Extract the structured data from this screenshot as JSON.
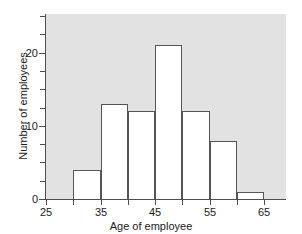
{
  "chart_data": {
    "type": "bar",
    "title": "",
    "xlabel": "Age of employee",
    "ylabel": "Number of employees",
    "xlim": [
      25,
      69
    ],
    "ylim": [
      0,
      25.3
    ],
    "bin_width": 5,
    "grid": false,
    "legend": null,
    "plot_background": "#e2e2e2",
    "bar_fill": "#ffffff",
    "bar_edge": "#555555",
    "axis_color": "#4d4d4d",
    "xticks": [
      25,
      30,
      35,
      40,
      45,
      50,
      55,
      60,
      65
    ],
    "xtick_labels": [
      "25",
      "",
      "35",
      "",
      "45",
      "",
      "55",
      "",
      "65"
    ],
    "yticks": [
      0,
      2.5,
      5,
      7.5,
      10,
      12.5,
      15,
      17.5,
      20,
      22.5,
      25
    ],
    "ytick_labels": [
      "0",
      "",
      "",
      "",
      "10",
      "",
      "",
      "",
      "20",
      "",
      ""
    ],
    "bins": [
      {
        "x0": 30,
        "x1": 35,
        "count": 4
      },
      {
        "x0": 35,
        "x1": 40,
        "count": 13
      },
      {
        "x0": 40,
        "x1": 45,
        "count": 12
      },
      {
        "x0": 45,
        "x1": 50,
        "count": 21
      },
      {
        "x0": 50,
        "x1": 55,
        "count": 12
      },
      {
        "x0": 55,
        "x1": 60,
        "count": 8
      },
      {
        "x0": 60,
        "x1": 65,
        "count": 1
      }
    ],
    "categories": [
      "30-35",
      "35-40",
      "40-45",
      "45-50",
      "50-55",
      "55-60",
      "60-65"
    ],
    "values": [
      4,
      13,
      12,
      21,
      12,
      8,
      1
    ]
  }
}
